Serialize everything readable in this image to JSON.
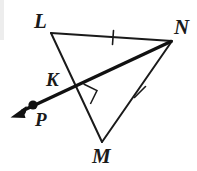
{
  "figure": {
    "type": "geometry-diagram",
    "background_color": "#ffffff",
    "stroke_color": "#1a1a1a",
    "canvas": {
      "width": 197,
      "height": 171
    },
    "labels": {
      "L": "L",
      "M": "M",
      "N": "N",
      "K": "K",
      "P": "P"
    },
    "points": {
      "L": {
        "x": 51,
        "y": 33
      },
      "N": {
        "x": 172,
        "y": 41
      },
      "M": {
        "x": 102,
        "y": 142
      },
      "K": {
        "x": 78,
        "y": 88
      },
      "P": {
        "x": 33,
        "y": 105
      },
      "arrow_tip": {
        "x": 11,
        "y": 117
      }
    },
    "segments": [
      {
        "name": "LN",
        "from": "L",
        "to": "N",
        "stroke_width": 2.0,
        "ticks": 1
      },
      {
        "name": "LM",
        "from": "L",
        "to": "M",
        "stroke_width": 2.0,
        "ticks": 0
      },
      {
        "name": "MN",
        "from": "M",
        "to": "N",
        "stroke_width": 2.0,
        "ticks": 1
      }
    ],
    "ray": {
      "name": "NP",
      "from": "N",
      "through": "K",
      "to": "arrow_tip",
      "stroke_width": 3.4,
      "has_arrowhead": true,
      "arrowhead_at": "arrow_tip"
    },
    "tick_marks": [
      {
        "on_segment": "LN",
        "x": 113,
        "y": 37,
        "angle_deg": 94
      },
      {
        "on_segment": "MN",
        "x": 140,
        "y": 92,
        "angle_deg": 46
      }
    ],
    "right_angle": {
      "at_point": "K",
      "x": 78,
      "y": 88,
      "size": 16,
      "marker": "square"
    },
    "dots": [
      {
        "at_point": "P",
        "x": 33,
        "y": 105,
        "radius": 4.6,
        "filled": true
      }
    ]
  }
}
